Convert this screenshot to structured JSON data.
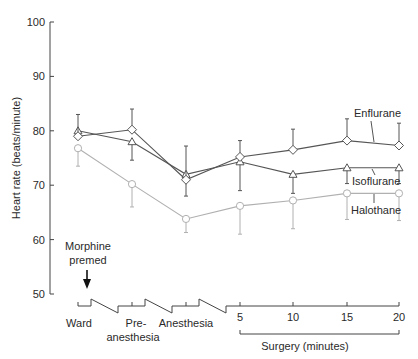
{
  "chart_data": {
    "type": "line",
    "title": "",
    "xlabel": "Surgery (minutes)",
    "ylabel": "Heart rate (beats/minute)",
    "ylim": [
      50,
      100
    ],
    "yticks": [
      50,
      60,
      70,
      80,
      90,
      100
    ],
    "categories": [
      "Ward",
      "Pre-anesthesia",
      "Anesthesia",
      "5",
      "10",
      "15",
      "20"
    ],
    "category_labels": {
      "ward": "Ward",
      "pre_line1": "Pre-",
      "pre_line2": "anesthesia",
      "anesthesia": "Anesthesia",
      "t5": "5",
      "t10": "10",
      "t15": "15",
      "t20": "20"
    },
    "annotation": {
      "line1": "Morphine",
      "line2": "premed"
    },
    "grid": false,
    "legend_position": "inline-right",
    "series": [
      {
        "name": "Enflurane",
        "marker": "diamond",
        "color": "#555555",
        "values": [
          79,
          80.2,
          71,
          75.2,
          76.5,
          78.2,
          77.3
        ],
        "error_upper": [
          83,
          84,
          77.2,
          78.2,
          80.3,
          82.2,
          81.4
        ],
        "error_lower": [
          null,
          null,
          68,
          null,
          null,
          null,
          null
        ]
      },
      {
        "name": "Isoflurane",
        "marker": "triangle",
        "color": "#555555",
        "values": [
          80,
          78,
          72,
          74.3,
          72,
          73.2,
          73.2
        ],
        "error_upper": [
          null,
          null,
          null,
          null,
          null,
          null,
          null
        ],
        "error_lower": [
          null,
          74.6,
          null,
          69,
          68.5,
          70.3,
          70.3
        ]
      },
      {
        "name": "Halothane",
        "marker": "circle",
        "color": "#b0b0b0",
        "values": [
          76.8,
          70.2,
          63.8,
          66.2,
          67.2,
          68.5,
          68.5
        ],
        "error_upper": [
          null,
          null,
          null,
          null,
          null,
          null,
          null
        ],
        "error_lower": [
          73.5,
          66,
          61.3,
          61,
          62,
          63.7,
          63.5
        ]
      }
    ]
  }
}
